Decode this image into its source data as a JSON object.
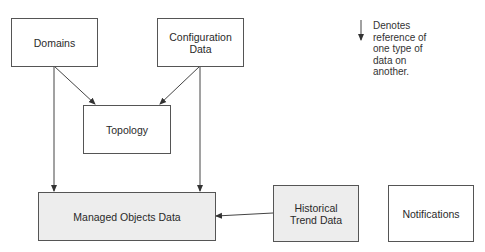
{
  "diagram": {
    "nodes": [
      {
        "id": "domains",
        "label": "Domains",
        "shaded": false
      },
      {
        "id": "configuration-data",
        "label": "Configuration\nData",
        "line1": "Configuration",
        "line2": "Data",
        "shaded": false
      },
      {
        "id": "topology",
        "label": "Topology",
        "shaded": false
      },
      {
        "id": "managed-objects-data",
        "label": "Managed Objects Data",
        "shaded": true
      },
      {
        "id": "historical-trend-data",
        "label": "Historical\nTrend Data",
        "line1": "Historical",
        "line2": "Trend Data",
        "shaded": true
      },
      {
        "id": "notifications",
        "label": "Notifications",
        "shaded": false
      }
    ],
    "edges": [
      {
        "from": "domains",
        "to": "topology"
      },
      {
        "from": "configuration-data",
        "to": "topology"
      },
      {
        "from": "domains",
        "to": "managed-objects-data"
      },
      {
        "from": "configuration-data",
        "to": "managed-objects-data"
      },
      {
        "from": "historical-trend-data",
        "to": "managed-objects-data"
      }
    ],
    "legend": {
      "symbol": "down-arrow",
      "lines": [
        "Denotes",
        "reference of",
        "one type of",
        "data on",
        "another."
      ]
    },
    "colors": {
      "stroke": "#555555",
      "shaded_fill": "#ededed",
      "background": "#ffffff"
    }
  }
}
